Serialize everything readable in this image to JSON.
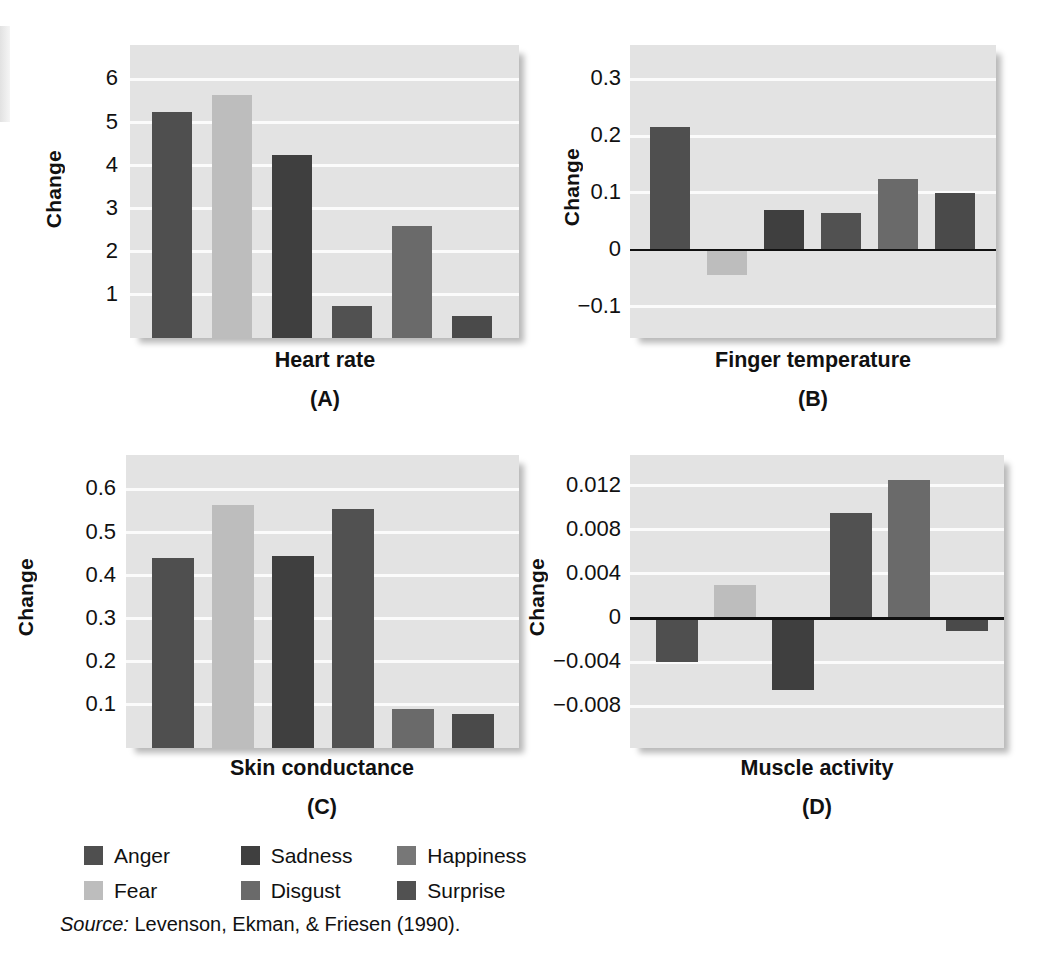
{
  "figure": {
    "source_prefix": "Source:",
    "source_text": "Levenson, Ekman, & Friesen (1990)."
  },
  "legend": {
    "items": [
      {
        "label": "Anger",
        "color": "#4f4f4f"
      },
      {
        "label": "Sadness",
        "color": "#3f3f3f"
      },
      {
        "label": "Happiness",
        "color": "#777777"
      },
      {
        "label": "Fear",
        "color": "#bdbdbd"
      },
      {
        "label": "Disgust",
        "color": "#6a6a6a"
      },
      {
        "label": "Surprise",
        "color": "#515151"
      }
    ]
  },
  "panels": [
    {
      "key": "A",
      "panel_label": "(A)",
      "ylabel": "Change",
      "xtitle": "Heart rate",
      "yticks": [
        "6",
        "5",
        "4",
        "3",
        "2",
        "1"
      ]
    },
    {
      "key": "B",
      "panel_label": "(B)",
      "ylabel": "Change",
      "xtitle": "Finger temperature",
      "yticks": [
        "0.3",
        "0.2",
        "0.1",
        "0",
        "−0.1"
      ]
    },
    {
      "key": "C",
      "panel_label": "(C)",
      "ylabel": "Change",
      "xtitle": "Skin conductance",
      "yticks": [
        "0.6",
        "0.5",
        "0.4",
        "0.3",
        "0.2",
        "0.1"
      ]
    },
    {
      "key": "D",
      "panel_label": "(D)",
      "ylabel": "Change",
      "xtitle": "Muscle activity",
      "yticks": [
        "0.012",
        "0.008",
        "0.004",
        "0",
        "−0.004",
        "−0.008"
      ]
    }
  ],
  "chart_data": [
    {
      "type": "bar",
      "panel": "A",
      "title": "Heart rate",
      "xlabel": "",
      "ylabel": "Change",
      "categories": [
        "Anger",
        "Fear",
        "Sadness",
        "Happiness",
        "Disgust",
        "Surprise"
      ],
      "values": [
        5.25,
        5.65,
        4.25,
        0.75,
        2.6,
        0.5
      ],
      "colors": [
        "#4f4f4f",
        "#bdbdbd",
        "#3f3f3f",
        "#515151",
        "#6a6a6a",
        "#4a4a4a"
      ],
      "ylim": [
        0,
        6.8
      ],
      "yticks": [
        1,
        2,
        3,
        4,
        5,
        6
      ],
      "grid": true,
      "legend": "bottom"
    },
    {
      "type": "bar",
      "panel": "B",
      "title": "Finger temperature",
      "xlabel": "",
      "ylabel": "Change",
      "categories": [
        "Anger",
        "Fear",
        "Sadness",
        "Happiness",
        "Disgust",
        "Surprise"
      ],
      "values": [
        0.215,
        -0.045,
        0.07,
        0.065,
        0.125,
        0.1
      ],
      "colors": [
        "#4f4f4f",
        "#bdbdbd",
        "#3f3f3f",
        "#515151",
        "#6a6a6a",
        "#4a4a4a"
      ],
      "ylim": [
        -0.155,
        0.36
      ],
      "yticks": [
        -0.1,
        0,
        0.1,
        0.2,
        0.3
      ],
      "grid": true,
      "legend": "bottom"
    },
    {
      "type": "bar",
      "panel": "C",
      "title": "Skin conductance",
      "xlabel": "",
      "ylabel": "Change",
      "categories": [
        "Anger",
        "Fear",
        "Sadness",
        "Happiness",
        "Disgust",
        "Surprise"
      ],
      "values": [
        0.44,
        0.565,
        0.445,
        0.555,
        0.09,
        0.08
      ],
      "colors": [
        "#4f4f4f",
        "#bdbdbd",
        "#3f3f3f",
        "#515151",
        "#6a6a6a",
        "#4a4a4a"
      ],
      "ylim": [
        0,
        0.68
      ],
      "yticks": [
        0.1,
        0.2,
        0.3,
        0.4,
        0.5,
        0.6
      ],
      "grid": true,
      "legend": "bottom"
    },
    {
      "type": "bar",
      "panel": "D",
      "title": "Muscle activity",
      "xlabel": "",
      "ylabel": "Change",
      "categories": [
        "Anger",
        "Fear",
        "Sadness",
        "Happiness",
        "Disgust",
        "Surprise"
      ],
      "values": [
        -0.004,
        0.003,
        -0.0065,
        0.0095,
        0.0125,
        -0.0012
      ],
      "colors": [
        "#4f4f4f",
        "#bdbdbd",
        "#3f3f3f",
        "#515151",
        "#6a6a6a",
        "#4a4a4a"
      ],
      "ylim": [
        -0.0118,
        0.0148
      ],
      "yticks": [
        -0.008,
        -0.004,
        0,
        0.004,
        0.008,
        0.012
      ],
      "grid": true,
      "legend": "bottom"
    }
  ]
}
